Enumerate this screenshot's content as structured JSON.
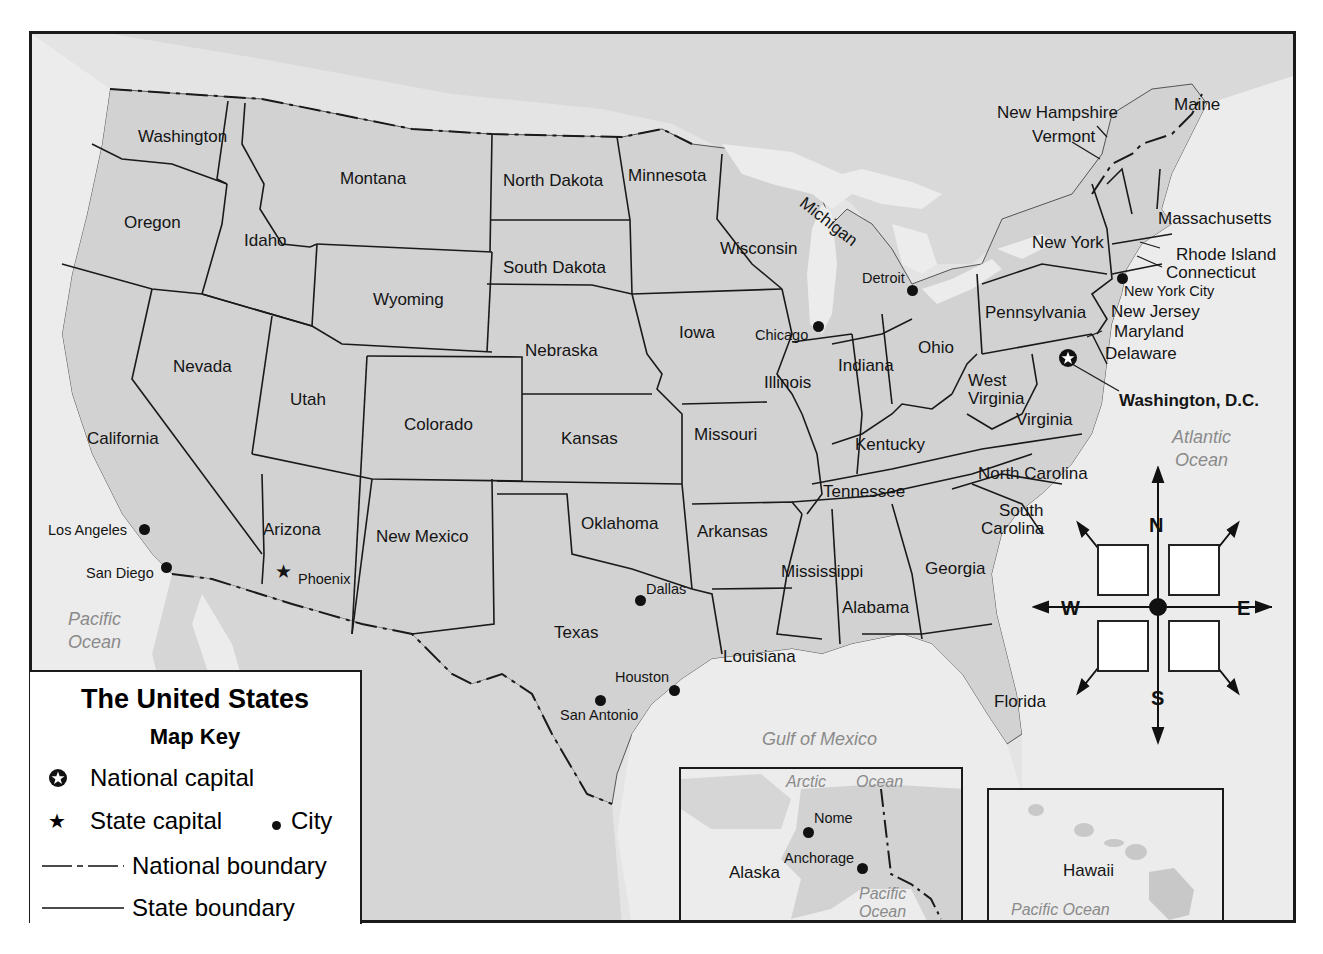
{
  "map": {
    "title": "The United States",
    "key_title": "Map Key",
    "legend": {
      "national_capital": "National capital",
      "state_capital": "State capital",
      "city": "City",
      "national_boundary": "National boundary",
      "state_boundary": "State boundary"
    },
    "colors": {
      "land": "#d6d6d6",
      "water": "#ececec",
      "border": "#1a1a1a",
      "ocean_text": "#8a8a8a"
    },
    "states": [
      {
        "name": "Washington",
        "x": 106,
        "y": 94
      },
      {
        "name": "Oregon",
        "x": 92,
        "y": 180
      },
      {
        "name": "Idaho",
        "x": 212,
        "y": 198
      },
      {
        "name": "Montana",
        "x": 308,
        "y": 136
      },
      {
        "name": "North Dakota",
        "x": 471,
        "y": 138
      },
      {
        "name": "Minnesota",
        "x": 596,
        "y": 133
      },
      {
        "name": "South Dakota",
        "x": 471,
        "y": 225
      },
      {
        "name": "Wyoming",
        "x": 341,
        "y": 257
      },
      {
        "name": "Wisconsin",
        "x": 688,
        "y": 206
      },
      {
        "name": "Michigan",
        "x": 775,
        "y": 160
      },
      {
        "name": "Nevada",
        "x": 141,
        "y": 324
      },
      {
        "name": "Utah",
        "x": 258,
        "y": 357
      },
      {
        "name": "Colorado",
        "x": 372,
        "y": 382
      },
      {
        "name": "Nebraska",
        "x": 493,
        "y": 308
      },
      {
        "name": "Iowa",
        "x": 647,
        "y": 290
      },
      {
        "name": "Illinois",
        "x": 732,
        "y": 340
      },
      {
        "name": "Indiana",
        "x": 806,
        "y": 323
      },
      {
        "name": "Ohio",
        "x": 886,
        "y": 305
      },
      {
        "name": "California",
        "x": 55,
        "y": 396
      },
      {
        "name": "Kansas",
        "x": 529,
        "y": 396
      },
      {
        "name": "Missouri",
        "x": 662,
        "y": 392
      },
      {
        "name": "Kentucky",
        "x": 823,
        "y": 402
      },
      {
        "name": "West",
        "x": 936,
        "y": 338
      },
      {
        "name": "Virginia",
        "x": 936,
        "y": 356
      },
      {
        "name": "Virginia",
        "x": 984,
        "y": 377
      },
      {
        "name": "Pennsylvania",
        "x": 953,
        "y": 270
      },
      {
        "name": "New York",
        "x": 1000,
        "y": 200
      },
      {
        "name": "Arizona",
        "x": 231,
        "y": 487
      },
      {
        "name": "New Mexico",
        "x": 344,
        "y": 494
      },
      {
        "name": "Oklahoma",
        "x": 549,
        "y": 481
      },
      {
        "name": "Arkansas",
        "x": 665,
        "y": 489
      },
      {
        "name": "Tennessee",
        "x": 791,
        "y": 449
      },
      {
        "name": "North Carolina",
        "x": 946,
        "y": 431
      },
      {
        "name": "South",
        "x": 967,
        "y": 468
      },
      {
        "name": "Carolina",
        "x": 949,
        "y": 486
      },
      {
        "name": "Texas",
        "x": 522,
        "y": 590
      },
      {
        "name": "Mississippi",
        "x": 749,
        "y": 529
      },
      {
        "name": "Alabama",
        "x": 810,
        "y": 565
      },
      {
        "name": "Georgia",
        "x": 893,
        "y": 526
      },
      {
        "name": "Louisiana",
        "x": 691,
        "y": 614
      },
      {
        "name": "Florida",
        "x": 962,
        "y": 659
      }
    ],
    "northeast_labels": [
      {
        "name": "New Hampshire",
        "x": 965,
        "y": 70
      },
      {
        "name": "Vermont",
        "x": 1000,
        "y": 94
      },
      {
        "name": "Maine",
        "x": 1142,
        "y": 62
      },
      {
        "name": "Massachusetts",
        "x": 1126,
        "y": 176
      },
      {
        "name": "Rhode Island",
        "x": 1144,
        "y": 212
      },
      {
        "name": "Connecticut",
        "x": 1134,
        "y": 230
      },
      {
        "name": "New Jersey",
        "x": 1079,
        "y": 269
      },
      {
        "name": "Maryland",
        "x": 1082,
        "y": 289
      },
      {
        "name": "Delaware",
        "x": 1073,
        "y": 311
      }
    ],
    "cities": [
      {
        "name": "Los Angeles",
        "x": 112,
        "y": 495,
        "lx": 16,
        "ly": 489
      },
      {
        "name": "San Diego",
        "x": 134,
        "y": 533,
        "lx": 54,
        "ly": 532
      },
      {
        "name": "Dallas",
        "x": 608,
        "y": 566,
        "lx": 614,
        "ly": 548
      },
      {
        "name": "Houston",
        "x": 642,
        "y": 656,
        "lx": 583,
        "ly": 636
      },
      {
        "name": "San Antonio",
        "x": 568,
        "y": 666,
        "lx": 528,
        "ly": 674
      },
      {
        "name": "Chicago",
        "x": 786,
        "y": 292,
        "lx": 723,
        "ly": 294
      },
      {
        "name": "Detroit",
        "x": 880,
        "y": 256,
        "lx": 830,
        "ly": 237
      },
      {
        "name": "New York City",
        "x": 1090,
        "y": 244,
        "lx": 1092,
        "ly": 250
      }
    ],
    "state_capitals": [
      {
        "name": "Phoenix",
        "x": 252,
        "y": 538,
        "lx": 261,
        "ly": 538
      }
    ],
    "national_capital": {
      "name": "Washington, D.C.",
      "x": 1036,
      "y": 324,
      "lx": 1087,
      "ly": 358
    },
    "water_labels": [
      {
        "name": "Pacific\nOcean",
        "x": 36,
        "y": 574
      },
      {
        "name": "Atlantic\nOcean",
        "x": 1140,
        "y": 392
      },
      {
        "name": "Gulf of Mexico",
        "x": 730,
        "y": 694
      }
    ],
    "compass": {
      "north": "N",
      "south": "S",
      "east": "E",
      "west": "W"
    },
    "insets": {
      "alaska": {
        "label": "Alaska",
        "cities": [
          {
            "name": "Nome"
          },
          {
            "name": "Anchorage"
          }
        ],
        "water": [
          "Arctic",
          "Ocean",
          "Pacific\nOcean"
        ]
      },
      "hawaii": {
        "label": "Hawaii",
        "water": "Pacific Ocean"
      }
    }
  }
}
